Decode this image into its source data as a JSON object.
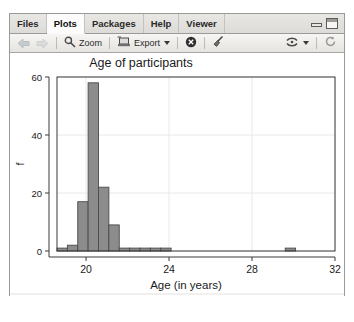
{
  "window": {
    "tabs": [
      {
        "label": "Files",
        "active": false
      },
      {
        "label": "Plots",
        "active": true
      },
      {
        "label": "Packages",
        "active": false
      },
      {
        "label": "Help",
        "active": false
      },
      {
        "label": "Viewer",
        "active": false
      }
    ],
    "controls": {
      "minimize": "minimize-icon",
      "maximize": "maximize-icon"
    }
  },
  "toolbar": {
    "back_icon": "back-arrow-icon",
    "forward_icon": "forward-arrow-icon",
    "zoom_icon": "magnifier-icon",
    "zoom_label": "Zoom",
    "export_icon": "export-icon",
    "export_label": "Export",
    "export_caret": "chevron-down-icon",
    "remove_icon": "remove-plot-icon",
    "clear_icon": "broom-icon",
    "publish_icon": "publish-icon",
    "publish_caret": "chevron-down-icon",
    "refresh_icon": "refresh-icon"
  },
  "chart_data": {
    "type": "bar",
    "title": "Age of participants",
    "xlabel": "Age (in years)",
    "ylabel": "f",
    "xlim": [
      18.6,
      32.0
    ],
    "ylim": [
      0,
      60
    ],
    "xticks": [
      20,
      24,
      28,
      32
    ],
    "yticks": [
      0,
      20,
      40,
      60
    ],
    "grid": true,
    "bin_width": 0.5,
    "bars": [
      {
        "x0": 18.6,
        "x1": 19.1,
        "value": 1
      },
      {
        "x0": 19.1,
        "x1": 19.6,
        "value": 2
      },
      {
        "x0": 19.6,
        "x1": 20.1,
        "value": 17
      },
      {
        "x0": 20.1,
        "x1": 20.6,
        "value": 58
      },
      {
        "x0": 20.6,
        "x1": 21.1,
        "value": 22
      },
      {
        "x0": 21.1,
        "x1": 21.6,
        "value": 9
      },
      {
        "x0": 21.6,
        "x1": 22.1,
        "value": 1
      },
      {
        "x0": 22.1,
        "x1": 22.6,
        "value": 1
      },
      {
        "x0": 22.6,
        "x1": 23.1,
        "value": 1
      },
      {
        "x0": 23.1,
        "x1": 23.6,
        "value": 1
      },
      {
        "x0": 23.6,
        "x1": 24.1,
        "value": 1
      },
      {
        "x0": 29.6,
        "x1": 30.1,
        "value": 1
      }
    ],
    "bar_fill": "#8c8c8c",
    "bar_stroke": "#4a4a4a"
  }
}
